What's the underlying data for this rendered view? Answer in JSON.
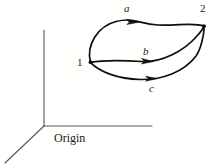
{
  "figure": {
    "background_color": "#fffffe",
    "stroke_color": "#0d0d0d",
    "axis_color": "#4d4d4d",
    "label_color": "#1a1a1a"
  },
  "axes": {
    "origin_label": "Origin",
    "origin_point": [
      44,
      126
    ],
    "vertical_axis_end": [
      44,
      30
    ],
    "horizontal_axis_end": [
      152,
      126
    ],
    "oblique_axis_end": [
      5,
      163
    ]
  },
  "states": [
    {
      "id": "state-1",
      "label": "1",
      "point": [
        90,
        62
      ]
    },
    {
      "id": "state-2",
      "label": "2",
      "point": [
        204,
        26
      ]
    }
  ],
  "paths": [
    {
      "id": "path-a",
      "label": "a",
      "from": "1",
      "to": "2",
      "arrow_at": [
        133,
        21
      ],
      "description": "upper curved path from state 1 to state 2"
    },
    {
      "id": "path-b",
      "label": "b",
      "from": "1",
      "to": "2",
      "arrow_at": [
        149,
        61
      ],
      "description": "middle curved path from state 1 to state 2"
    },
    {
      "id": "path-c",
      "label": "c",
      "from": "1",
      "to": "2",
      "arrow_at": [
        152,
        78
      ],
      "description": "lower curved path from state 1 to state 2"
    }
  ]
}
